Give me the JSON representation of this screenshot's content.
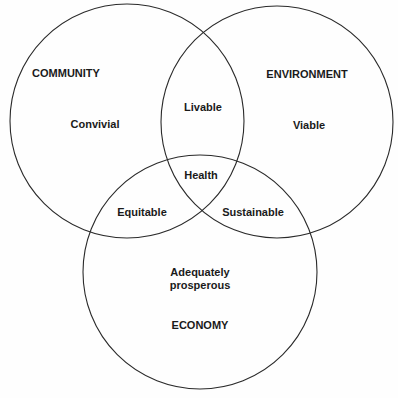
{
  "diagram": {
    "type": "venn",
    "colors": {
      "stroke": "#2a2a2a",
      "text": "#1a1a1a",
      "background": "#fefefe"
    },
    "sets": [
      {
        "id": "community",
        "title": "COMMUNITY",
        "quality": "Convivial",
        "cx": 127,
        "cy": 121,
        "r": 117
      },
      {
        "id": "environment",
        "title": "ENVIRONMENT",
        "quality": "Viable",
        "cx": 277,
        "cy": 122,
        "r": 116
      },
      {
        "id": "economy",
        "title": "ECONOMY",
        "quality": "Adequately prosperous",
        "quality_lines": [
          "Adequately",
          "prosperous"
        ],
        "cx": 200,
        "cy": 272,
        "r": 117
      }
    ],
    "intersections": {
      "community_environment": "Livable",
      "community_economy": "Equitable",
      "environment_economy": "Sustainable",
      "all": "Health"
    }
  }
}
